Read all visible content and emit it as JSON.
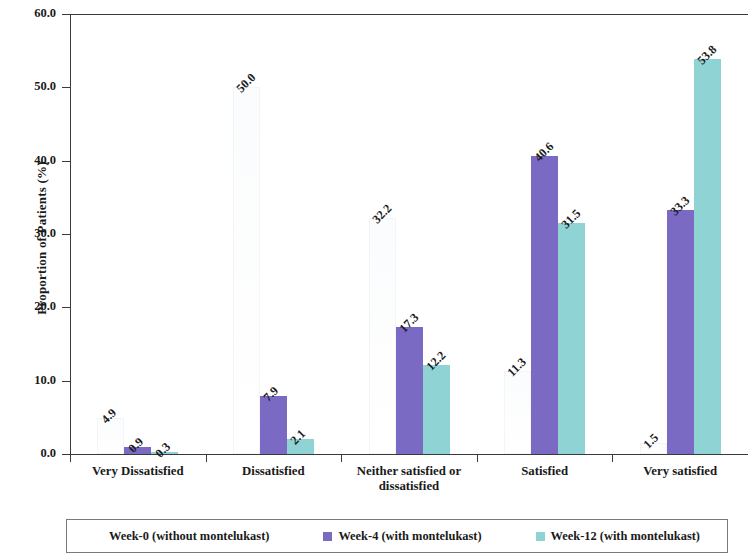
{
  "chart_data": {
    "type": "bar",
    "title": "",
    "xlabel": "",
    "ylabel": "Proportion of Patients (%)",
    "ylim": [
      0,
      60
    ],
    "ytick_step": 10,
    "ytick_labels": [
      "0.0",
      "10.0",
      "20.0",
      "30.0",
      "40.0",
      "50.0",
      "60.0"
    ],
    "ytick_values": [
      0,
      10,
      20,
      30,
      40,
      50,
      60
    ],
    "grid": false,
    "legend_position": "bottom",
    "categories": [
      "Very Dissatisfied",
      "Dissatisfied",
      "Neither satisfied or dissatisfied",
      "Satisfied",
      "Very satisfied"
    ],
    "series": [
      {
        "name": "Week-0 (without montelukast)",
        "color": "#fdfdfd",
        "values": [
          4.9,
          50.0,
          32.2,
          11.3,
          1.5
        ],
        "labels": [
          "4.9",
          "50.0",
          "32.2",
          "11.3",
          "1.5"
        ]
      },
      {
        "name": "Week-4 (with montelukast)",
        "color": "#7b6ac4",
        "values": [
          0.9,
          7.9,
          17.3,
          40.6,
          33.3
        ],
        "labels": [
          "0.9",
          "7.9",
          "17.3",
          "40.6",
          "33.3"
        ]
      },
      {
        "name": "Week-12 (with montelukast)",
        "color": "#8fd3d4",
        "values": [
          0.3,
          2.1,
          12.2,
          31.5,
          53.8
        ],
        "labels": [
          "0.3",
          "2.1",
          "12.2",
          "31.5",
          "53.8"
        ]
      }
    ]
  },
  "legend": {
    "items": [
      {
        "label": "Week-0 (without montelukast)",
        "color": "#fdfdfd"
      },
      {
        "label": "Week-4 (with montelukast)",
        "color": "#7b6ac4"
      },
      {
        "label": "Week-12 (with montelukast)",
        "color": "#8fd3d4"
      }
    ]
  },
  "axes": {
    "y_title": "Proportion of Patients (%)"
  }
}
